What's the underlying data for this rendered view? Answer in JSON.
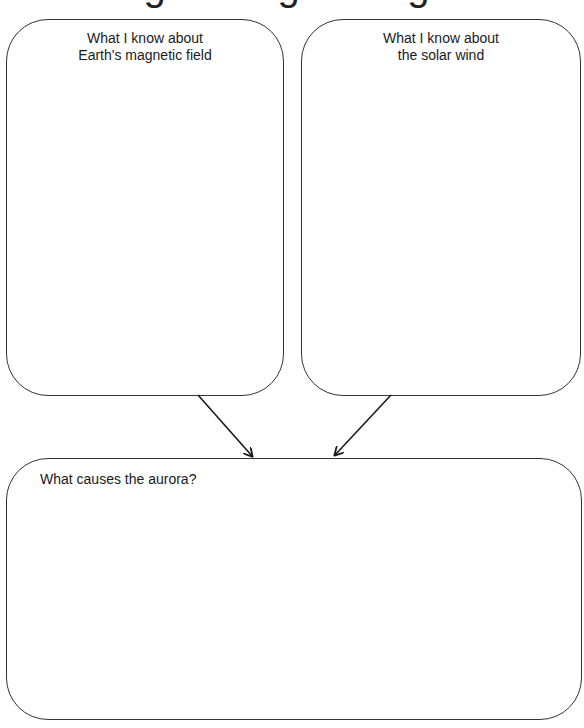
{
  "title": {
    "text": "Organizing Thoughts",
    "note": "title is cropped; only descender bottoms visible"
  },
  "boxes": {
    "left": {
      "line1": "What I know about",
      "line2": "Earth's magnetic field"
    },
    "right": {
      "line1": "What I know about",
      "line2": "the solar wind"
    },
    "bottom": {
      "label": "What causes the aurora?"
    }
  },
  "arrows": [
    {
      "from": "left",
      "to": "bottom",
      "x1": 198,
      "y1": 395,
      "x2": 253,
      "y2": 457
    },
    {
      "from": "right",
      "to": "bottom",
      "x1": 391,
      "y1": 395,
      "x2": 334,
      "y2": 456
    }
  ],
  "colors": {
    "stroke": "#333333",
    "text": "#1a1a1a",
    "background": "#ffffff"
  }
}
